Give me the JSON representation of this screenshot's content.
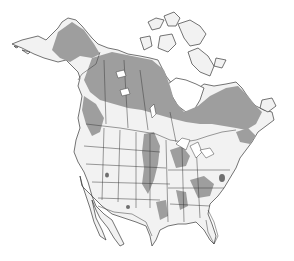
{
  "map": {
    "title": "",
    "region": "North America",
    "colors": {
      "background": "#ffffff",
      "land": "#f2f2f2",
      "range_primary": "#9e9e9e",
      "range_secondary": "#d6d6d6",
      "range_dark": "#6f6f6f",
      "borders": "#3a3a3a"
    },
    "legend": []
  }
}
